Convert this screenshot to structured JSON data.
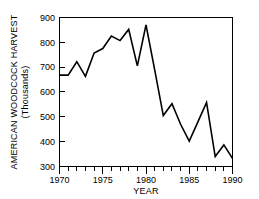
{
  "chart_data": {
    "type": "line",
    "title": "",
    "xlabel": "YEAR",
    "ylabel": "AMERICAN WOODCOCK HARVEST",
    "ylabel_sub": "(Thousands)",
    "x": [
      1970,
      1971,
      1972,
      1973,
      1974,
      1975,
      1976,
      1977,
      1978,
      1979,
      1980,
      1981,
      1982,
      1983,
      1984,
      1985,
      1986,
      1987,
      1988,
      1989,
      1990
    ],
    "values": [
      668,
      668,
      722,
      663,
      757,
      775,
      825,
      807,
      852,
      705,
      870,
      690,
      505,
      553,
      470,
      402,
      480,
      558,
      340,
      387,
      333
    ],
    "series": [
      {
        "name": "American Woodcock Harvest",
        "values": [
          668,
          668,
          722,
          663,
          757,
          775,
          825,
          807,
          852,
          705,
          870,
          690,
          505,
          553,
          470,
          402,
          480,
          558,
          340,
          387,
          333
        ]
      }
    ],
    "xlim": [
      1970,
      1990
    ],
    "ylim": [
      300,
      900
    ],
    "x_major_ticks": [
      1970,
      1975,
      1980,
      1985,
      1990
    ],
    "x_major_tick_labels": [
      "1970",
      "1975",
      "1980",
      "1985",
      "1990"
    ],
    "x_minor_tick_interval": 1,
    "y_ticks": [
      300,
      400,
      500,
      600,
      700,
      800,
      900
    ],
    "y_tick_labels": [
      "300",
      "400",
      "500",
      "600",
      "700",
      "800",
      "900"
    ],
    "grid": false,
    "legend": null,
    "line_color": "#000000",
    "background_color": "#ffffff"
  }
}
